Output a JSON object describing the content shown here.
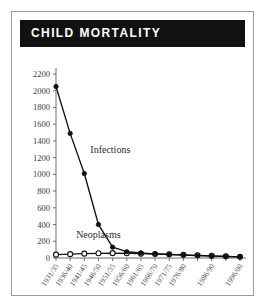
{
  "panel": {
    "title": "CHILD MORTALITY"
  },
  "chart_data": {
    "type": "line",
    "title": "CHILD MORTALITY",
    "xlabel": "",
    "ylabel": "",
    "ylim": [
      0,
      2200
    ],
    "ytick_step": 200,
    "yticks": [
      0,
      200,
      400,
      600,
      800,
      1000,
      1200,
      1400,
      1600,
      1800,
      2000,
      2200
    ],
    "grid": false,
    "legend": "inline-annotations",
    "categories": [
      "1931/35",
      "1936/40",
      "1941/45",
      "1946/50",
      "1951/55",
      "1956/60",
      "1961/65",
      "1966/70",
      "1971/75",
      "1976/80",
      "1981/85",
      "1986/90",
      "1991/95",
      "1996/00"
    ],
    "xtick_labels_shown": [
      "1931/35",
      "1936/40",
      "1941/45",
      "1946/50",
      "1951/55",
      "1956/60",
      "1961/65",
      "1966/70",
      "1971/75",
      "1976/80",
      "1986/90",
      "1996/00"
    ],
    "series": [
      {
        "name": "Infections",
        "marker": "filled-circle",
        "values": [
          2050,
          1490,
          1010,
          400,
          130,
          75,
          60,
          50,
          42,
          34,
          28,
          22,
          18,
          14
        ]
      },
      {
        "name": "Neoplasms",
        "marker": "open-circle",
        "values": [
          40,
          46,
          52,
          56,
          58,
          56,
          52,
          48,
          44,
          38,
          32,
          26,
          20,
          14
        ]
      }
    ],
    "annotations": [
      {
        "text": "Infections",
        "x_category": "1941/45",
        "y_value": 1250
      },
      {
        "text": "Neoplasms",
        "x_category": "1936/40",
        "y_value": 240
      }
    ]
  }
}
